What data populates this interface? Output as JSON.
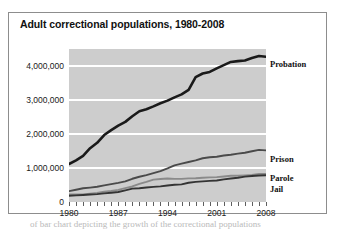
{
  "chart_data": {
    "type": "line",
    "title": "Adult correctional populations, 1980-2008",
    "xlabel": "",
    "ylabel": "",
    "xlim": [
      1980,
      2008
    ],
    "ylim": [
      0,
      4500000
    ],
    "grid": true,
    "legend_position": "right-inline-end-labels",
    "y_ticks": [
      0,
      1000000,
      2000000,
      3000000,
      4000000
    ],
    "y_tick_labels": [
      "0",
      "1,000,000",
      "2,000,000",
      "3,000,000",
      "4,000,000"
    ],
    "x_ticks": [
      1980,
      1987,
      1994,
      2001,
      2008
    ],
    "x_tick_labels": [
      "1980",
      "1987",
      "1994",
      "2001",
      "2008"
    ],
    "x": [
      1980,
      1981,
      1982,
      1983,
      1984,
      1985,
      1986,
      1987,
      1988,
      1989,
      1990,
      1991,
      1992,
      1993,
      1994,
      1995,
      1996,
      1997,
      1998,
      1999,
      2000,
      2001,
      2002,
      2003,
      2004,
      2005,
      2006,
      2007,
      2008
    ],
    "series": [
      {
        "name": "Probation",
        "color": "#1a1a1a",
        "values": [
          1118097,
          1225934,
          1357264,
          1582947,
          1740948,
          1968712,
          2114621,
          2247158,
          2356483,
          2522125,
          2670234,
          2728472,
          2811611,
          2903061,
          2981022,
          3077861,
          3164996,
          3296513,
          3670441,
          3779922,
          3826209,
          3931731,
          4024067,
          4120012,
          4143792,
          4162536,
          4236800,
          4293163,
          4270917
        ]
      },
      {
        "name": "Prison",
        "color": "#4a4a4a",
        "values": [
          319598,
          360029,
          402914,
          423898,
          448264,
          487593,
          526436,
          562814,
          607766,
          683367,
          743382,
          792535,
          850566,
          909381,
          990147,
          1078542,
          1127528,
          1176564,
          1224469,
          1287172,
          1316333,
          1330007,
          1367547,
          1390279,
          1421345,
          1448344,
          1492973,
          1532817,
          1518559
        ]
      },
      {
        "name": "Parole",
        "color": "#8a8a8a",
        "values": [
          220438,
          225539,
          224604,
          246440,
          266992,
          300203,
          325638,
          355505,
          407977,
          456803,
          531407,
          590442,
          658601,
          676100,
          690371,
          679421,
          679733,
          694787,
          696385,
          714457,
          723898,
          732333,
          750934,
          769925,
          771852,
          784408,
          798202,
          826097,
          828169
        ]
      },
      {
        "name": "Jail",
        "color": "#343434",
        "values": [
          182288,
          195085,
          207853,
          221815,
          233018,
          254986,
          272735,
          294092,
          341893,
          393303,
          405320,
          426479,
          444584,
          459804,
          486474,
          507044,
          518492,
          567079,
          592462,
          605943,
          621149,
          631240,
          665475,
          691301,
          713990,
          747529,
          765819,
          780174,
          785556
        ]
      }
    ],
    "end_labels": [
      {
        "name": "Probation",
        "top_px": 46
      },
      {
        "name": "Prison",
        "top_px": 141
      },
      {
        "name": "Parole",
        "top_px": 160
      },
      {
        "name": "Jail",
        "top_px": 171
      }
    ]
  },
  "caption": {
    "text": "of bar chart depicting the growth of the correctional populations"
  },
  "colors": {
    "plot_background": "#cdcdcd",
    "gridline": "#ffffff",
    "frame_border": "#8d8d8d",
    "text": "#111111"
  }
}
